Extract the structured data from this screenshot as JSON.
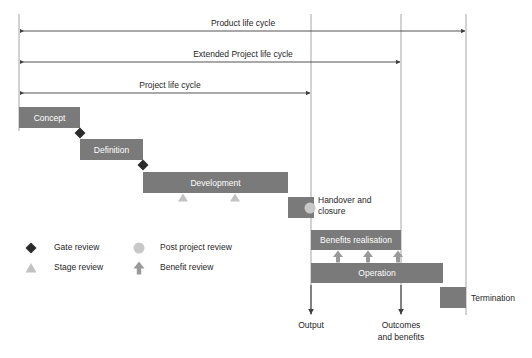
{
  "diagram": {
    "canvas": {
      "width": 532,
      "height": 358
    },
    "colors": {
      "bar_fill": "#7a7a7a",
      "bar_text": "#ffffff",
      "dark_marker": "#3f3f3f",
      "light_marker": "#c8c8c8",
      "line": "#595959",
      "guide_line": "#a6a6a6",
      "text": "#262626",
      "background": "#ffffff"
    }
  },
  "spans": [
    {
      "id": "product-life-cycle",
      "label": "Product life cycle",
      "x1": 19,
      "x2": 466,
      "y": 31,
      "label_x": 243,
      "label_y": 26
    },
    {
      "id": "extended-project-life-cycle",
      "label": "Extended Project life cycle",
      "x1": 19,
      "x2": 401,
      "y": 62,
      "label_x": 243,
      "label_y": 57
    },
    {
      "id": "project-life-cycle",
      "label": "Project life cycle",
      "x1": 19,
      "x2": 311,
      "y": 93,
      "label_x": 170,
      "label_y": 88
    }
  ],
  "verticals": [
    {
      "id": "output-line",
      "x": 311,
      "y1": 14,
      "y2": 315
    },
    {
      "id": "outcomes-line",
      "x": 401,
      "y1": 14,
      "y2": 315
    },
    {
      "id": "termination-line",
      "x": 466,
      "y1": 14,
      "y2": 315
    },
    {
      "id": "start-line",
      "x": 19,
      "y1": 14,
      "y2": 131
    }
  ],
  "bars": [
    {
      "id": "concept",
      "label": "Concept",
      "x": 19,
      "y": 107,
      "width": 61,
      "height": 21
    },
    {
      "id": "definition",
      "label": "Definition",
      "x": 80,
      "y": 139,
      "width": 63,
      "height": 21
    },
    {
      "id": "development",
      "label": "Development",
      "x": 143,
      "y": 172,
      "width": 145,
      "height": 21
    },
    {
      "id": "handover-and-closure",
      "label": "",
      "x": 288,
      "y": 197,
      "width": 26,
      "height": 21
    },
    {
      "id": "benefits-realisation",
      "label": "Benefits realisation",
      "x": 311,
      "y": 230,
      "width": 90,
      "height": 20
    },
    {
      "id": "operation",
      "label": "Operation",
      "x": 311,
      "y": 263,
      "width": 132,
      "height": 20
    },
    {
      "id": "termination",
      "label": "",
      "x": 440,
      "y": 287,
      "width": 26,
      "height": 21
    }
  ],
  "bar_side_labels": [
    {
      "id": "handover-label",
      "line1": "Handover and",
      "line2": "closure",
      "x": 318,
      "y": 203
    },
    {
      "id": "termination-label",
      "line1": "Termination",
      "line2": "",
      "x": 471,
      "y": 301
    }
  ],
  "gate_reviews": [
    {
      "id": "gate-review-1",
      "x": 80,
      "y": 133
    },
    {
      "id": "gate-review-2",
      "x": 143,
      "y": 165
    }
  ],
  "stage_reviews": [
    {
      "id": "stage-review-1",
      "x": 183,
      "y": 197
    },
    {
      "id": "stage-review-2",
      "x": 235,
      "y": 197
    }
  ],
  "post_project_reviews": [
    {
      "id": "post-project-review-1",
      "x": 310,
      "y": 208
    }
  ],
  "benefit_reviews": [
    {
      "id": "benefit-review-1",
      "x": 338,
      "y": 257
    },
    {
      "id": "benefit-review-2",
      "x": 368,
      "y": 257
    },
    {
      "id": "benefit-review-3",
      "x": 398,
      "y": 257
    }
  ],
  "legend": {
    "items": [
      {
        "id": "legend-gate-review",
        "marker": "diamond-icon",
        "label": "Gate review",
        "marker_x": 31,
        "label_x": 54,
        "y": 248
      },
      {
        "id": "legend-stage-review",
        "marker": "triangle-icon",
        "label": "Stage review",
        "marker_x": 31,
        "label_x": 54,
        "y": 268
      },
      {
        "id": "legend-post-project-review",
        "marker": "circle-icon",
        "label": "Post project review",
        "marker_x": 139,
        "label_x": 160,
        "y": 248
      },
      {
        "id": "legend-benefit-review",
        "marker": "up-arrow-icon",
        "label": "Benefit review",
        "marker_x": 139,
        "label_x": 160,
        "y": 268
      }
    ]
  },
  "outputs": [
    {
      "id": "output-marker",
      "label_line1": "Output",
      "label_line2": "",
      "x": 311,
      "arrow_y1": 283,
      "arrow_y2": 315,
      "label_y": 328
    },
    {
      "id": "outcomes-marker",
      "label_line1": "Outcomes",
      "label_line2": "and  benefits",
      "x": 401,
      "arrow_y1": 283,
      "arrow_y2": 315,
      "label_y": 328
    }
  ]
}
